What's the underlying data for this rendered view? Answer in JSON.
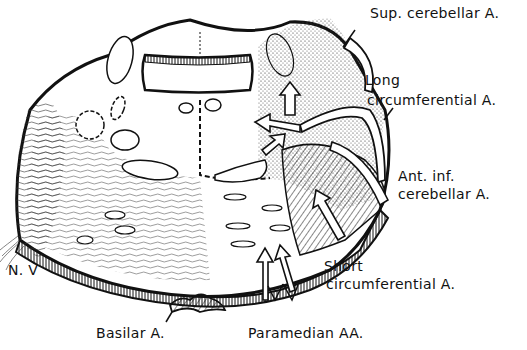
{
  "figure": {
    "type": "anatomical line drawing"
  },
  "labels": {
    "sup_cerebellar": "Sup. cerebellar A.",
    "long_circ_1": "Long",
    "long_circ_2": "circumferential A.",
    "ant_inf_1": "Ant. inf.",
    "ant_inf_2": "cerebellar A.",
    "short_circ_1": "Short",
    "short_circ_2": "circumferential A.",
    "nerve": "N. V",
    "basilar": "Basilar A.",
    "paramedian": "Paramedian AA."
  },
  "colors": {
    "ink": "#111111",
    "background": "#ffffff"
  }
}
